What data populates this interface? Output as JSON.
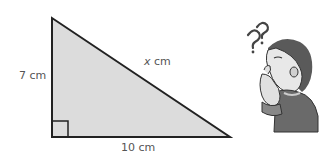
{
  "diagram": {
    "type": "right-triangle",
    "fill_color": "#dcdcdc",
    "stroke_color": "#222222",
    "vertices": {
      "top": [
        52,
        18
      ],
      "bottom_left": [
        52,
        137
      ],
      "bottom_right": [
        230,
        137
      ]
    },
    "right_angle_marker": true,
    "labels": {
      "vertical_side": "7 cm",
      "horizontal_side": "10 cm",
      "hypotenuse_var": "x",
      "hypotenuse_unit": " cm"
    }
  },
  "illustration": {
    "description": "confused person with question marks",
    "question_marks": "??"
  }
}
